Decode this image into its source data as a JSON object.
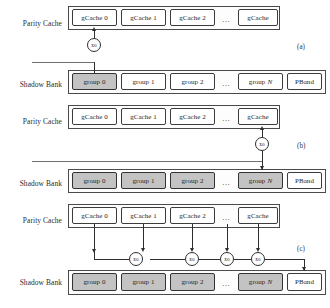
{
  "figure": {
    "panels": [
      {
        "letter": "(a)",
        "rows": {
          "parity_cache": {
            "label": "Parity Cache",
            "cells": [
              {
                "text": "gCache 0",
                "shaded": false
              },
              {
                "text": "gCache 1",
                "shaded": false
              },
              {
                "text": "gCache 2",
                "shaded": false
              },
              {
                "text": "gCache",
                "shaded": false
              }
            ],
            "ellipsis": "…"
          },
          "shadow_bank": {
            "label": "Shadow Bank",
            "cells": [
              {
                "text": "group 0",
                "shaded": true
              },
              {
                "text": "group 1",
                "shaded": false
              },
              {
                "text": "group 2",
                "shaded": false
              },
              {
                "text": "group",
                "italic": "N",
                "shaded": false
              },
              {
                "text": "PBand",
                "shaded": false
              }
            ],
            "ellipsis": "…"
          }
        },
        "xor_nodes": [
          {
            "label": "xo"
          }
        ]
      },
      {
        "letter": "(b)",
        "rows": {
          "parity_cache": {
            "label": "Parity Cache",
            "cells": [
              {
                "text": "gCache 0",
                "shaded": false
              },
              {
                "text": "gCache 1",
                "shaded": false
              },
              {
                "text": "gCache 2",
                "shaded": false
              },
              {
                "text": "gCache",
                "shaded": false
              }
            ],
            "ellipsis": "…"
          },
          "shadow_bank": {
            "label": "Shadow Bank",
            "cells": [
              {
                "text": "group 0",
                "shaded": true
              },
              {
                "text": "group 1",
                "shaded": true
              },
              {
                "text": "group 2",
                "shaded": true
              },
              {
                "text": "group",
                "italic": "N",
                "shaded": true
              },
              {
                "text": "PBand",
                "shaded": false
              }
            ],
            "ellipsis": "…"
          }
        },
        "xor_nodes": [
          {
            "label": "xo"
          }
        ]
      },
      {
        "letter": "(c)",
        "rows": {
          "parity_cache": {
            "label": "Parity Cache",
            "cells": [
              {
                "text": "gCache 0",
                "shaded": false
              },
              {
                "text": "gCache 1",
                "shaded": false
              },
              {
                "text": "gCache 2",
                "shaded": false
              },
              {
                "text": "gCache",
                "shaded": false
              }
            ],
            "ellipsis": "…"
          },
          "shadow_bank": {
            "label": "Shadow Bank",
            "cells": [
              {
                "text": "group 0",
                "shaded": true
              },
              {
                "text": "group 1",
                "shaded": true
              },
              {
                "text": "group 2",
                "shaded": true
              },
              {
                "text": "group",
                "italic": "N",
                "shaded": true
              },
              {
                "text": "PBand",
                "shaded": false
              }
            ],
            "ellipsis": "…"
          }
        },
        "xor_nodes": [
          {
            "label": "xo"
          },
          {
            "label": "xo"
          },
          {
            "label": "xo"
          },
          {
            "label": "xo"
          }
        ]
      }
    ],
    "colors": {
      "shaded_fill": "#c3c3c3",
      "box_stroke": "#3c3c3c",
      "line": "#2e2e2e",
      "background": "#ffffff"
    }
  }
}
